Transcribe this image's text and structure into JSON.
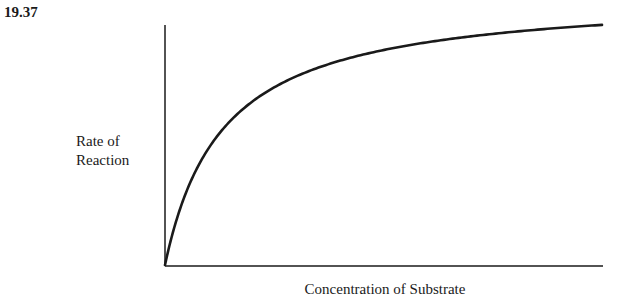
{
  "figure": {
    "number": "19.37"
  },
  "chart_data": {
    "type": "line",
    "title": "",
    "xlabel": "Concentration of Substrate",
    "ylabel_lines": [
      "Rate of",
      "Reaction"
    ],
    "ylabel": "Rate of Reaction",
    "grid": false,
    "legend": null,
    "ticks": {
      "x": [],
      "y": []
    },
    "model": {
      "form": "y = Vmax*x/(Km+x)",
      "Vmax_rel": 1.0,
      "Km_rel": 0.13
    },
    "series": [
      {
        "name": "Rate of Reaction",
        "x": [
          0,
          0.05,
          0.1,
          0.15,
          0.2,
          0.3,
          0.4,
          0.5,
          0.6,
          0.7,
          0.8,
          0.9,
          1.0
        ],
        "values": [
          0,
          0.28,
          0.44,
          0.54,
          0.61,
          0.7,
          0.75,
          0.79,
          0.82,
          0.84,
          0.86,
          0.87,
          0.88
        ]
      }
    ],
    "xlim": [
      0,
      1
    ],
    "ylim": [
      0,
      1
    ]
  },
  "plot": {
    "origin_x": 165,
    "origin_y": 265,
    "x_end": 603,
    "y_top": 25,
    "curve": {
      "vmax_px": 272,
      "km_px": 58,
      "x_span_px": 437
    },
    "line_color": "#1a1a1a"
  }
}
